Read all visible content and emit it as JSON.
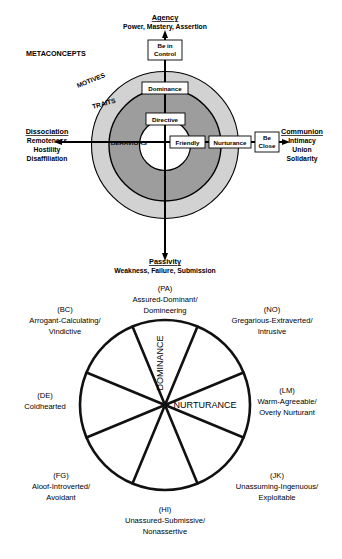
{
  "figure_top": {
    "name": "interpersonal-circumplex-levels",
    "poles": {
      "top": {
        "title": "Agency",
        "subtitle": "Power, Mastery, Assertion"
      },
      "bottom": {
        "title": "Passivity",
        "subtitle": "Weakness, Failure, Submission"
      },
      "left": {
        "title": "Dissociation",
        "lines": [
          "Remoteness",
          "Hostility",
          "Disaffiliation"
        ]
      },
      "right": {
        "title": "Communion",
        "lines": [
          "Intimacy",
          "Union",
          "Solidarity"
        ]
      }
    },
    "corner_label": "METACONCEPTS",
    "rings": [
      {
        "key": "motives",
        "label": "MOTIVES",
        "fill": "#d0d0d0"
      },
      {
        "key": "traits",
        "label": "TRAITS",
        "fill": "#9e9e9e"
      },
      {
        "key": "behaviors",
        "label": "BEHAVIORS",
        "fill": "#ffffff"
      }
    ],
    "nodes": {
      "agency_motive": "Be in\nControl",
      "agency_motive_l1": "Be in",
      "agency_motive_l2": "Control",
      "agency_trait": "Dominance",
      "agency_behavior": "Directive",
      "communion_behavior": "Friendly",
      "communion_trait": "Nurturance",
      "communion_motive_l1": "Be",
      "communion_motive_l2": "Close"
    }
  },
  "figure_bottom": {
    "name": "interpersonal-circumplex-octants",
    "axis_labels": {
      "vertical": "DOMINANCE",
      "horizontal": "NURTURANCE"
    },
    "octants": [
      {
        "code": "(PA)",
        "lines": [
          "Assured-Dominant/",
          "Domineering"
        ],
        "position": "top"
      },
      {
        "code": "(NO)",
        "lines": [
          "Gregarious-Extraverted/",
          "Intrusive"
        ],
        "position": "top-right"
      },
      {
        "code": "(LM)",
        "lines": [
          "Warm-Agreeable/",
          "Overly Nurturant"
        ],
        "position": "right"
      },
      {
        "code": "(JK)",
        "lines": [
          "Unassuming-Ingenuous/",
          "Exploitable"
        ],
        "position": "bottom-right"
      },
      {
        "code": "(HI)",
        "lines": [
          "Unassured-Submissive/",
          "Nonassertive"
        ],
        "position": "bottom"
      },
      {
        "code": "(FG)",
        "lines": [
          "Aloof-Introverted/",
          "Avoidant"
        ],
        "position": "bottom-left"
      },
      {
        "code": "(DE)",
        "lines": [
          "Coldhearted"
        ],
        "position": "left"
      },
      {
        "code": "(BC)",
        "lines": [
          "Arrogant-Calculating/",
          "Vindictive"
        ],
        "position": "top-left"
      }
    ]
  },
  "colors": {
    "outer_ring": "#d2d2d2",
    "middle_ring": "#9d9d9d",
    "inner_core": "#ffffff",
    "stroke": "#000000",
    "text": "#111111"
  }
}
